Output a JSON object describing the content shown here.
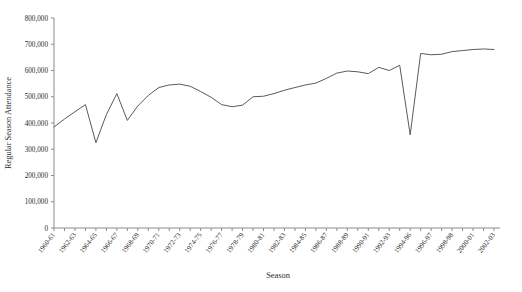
{
  "chart_data": {
    "type": "line",
    "title": "",
    "xlabel": "Season",
    "ylabel": "Regular Season Attendance",
    "ylim": [
      0,
      800000
    ],
    "yticks": [
      0,
      100000,
      200000,
      300000,
      400000,
      500000,
      600000,
      700000,
      800000
    ],
    "ytick_labels": [
      "0",
      "100,000",
      "200,000",
      "300,000",
      "400,000",
      "500,000",
      "600,000",
      "700,000",
      "800,000"
    ],
    "grid": false,
    "legend": false,
    "line_color": "#5a5a5a",
    "axis_color": "#8a8a8a",
    "categories": [
      "1960-61",
      "1961-62",
      "1962-63",
      "1963-64",
      "1964-65",
      "1965-66",
      "1966-67",
      "1967-68",
      "1968-69",
      "1969-70",
      "1970-71",
      "1971-72",
      "1972-73",
      "1973-74",
      "1974-75",
      "1975-76",
      "1976-77",
      "1977-78",
      "1978-79",
      "1979-80",
      "1980-81",
      "1981-82",
      "1982-83",
      "1983-84",
      "1984-85",
      "1985-86",
      "1986-87",
      "1987-88",
      "1988-89",
      "1989-90",
      "1990-91",
      "1991-92",
      "1992-93",
      "1993-94",
      "1994-96",
      "1995-96",
      "1996-97",
      "1997-98",
      "1998-99",
      "1999-00",
      "2000-01",
      "2001-02",
      "2002-03"
    ],
    "xtick_labels": [
      "1960-61",
      "1962-63",
      "1964-65",
      "1966-67",
      "1968-69",
      "1970-71",
      "1972-73",
      "1974-75",
      "1976-77",
      "1978-79",
      "1980-81",
      "1982-83",
      "1984-85",
      "1986-87",
      "1988-89",
      "1990-91",
      "1992-93",
      "1994-96",
      "1996-97",
      "1998-98",
      "2000-01",
      "2002-03"
    ],
    "values": [
      385000,
      415000,
      443000,
      470000,
      325000,
      432000,
      512000,
      410000,
      465000,
      505000,
      535000,
      545000,
      548000,
      540000,
      520000,
      498000,
      470000,
      462000,
      468000,
      500000,
      502000,
      512000,
      525000,
      535000,
      545000,
      552000,
      570000,
      590000,
      598000,
      595000,
      588000,
      612000,
      600000,
      620000,
      355000,
      665000,
      660000,
      662000,
      672000,
      676000,
      680000,
      682000,
      680000
    ]
  }
}
